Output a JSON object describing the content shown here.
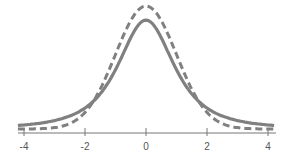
{
  "chart_data": {
    "type": "line",
    "title": "",
    "xlabel": "",
    "ylabel": "",
    "xlim": [
      -4.2,
      4.2
    ],
    "x_ticks": [
      -4,
      -2,
      0,
      2,
      4
    ],
    "x_tick_labels": [
      "-4",
      "-2",
      "0",
      "2",
      "4"
    ],
    "grid": false,
    "legend": null,
    "series": [
      {
        "name": "standard normal",
        "style": "dashed",
        "color": "#808080",
        "peak": 0.399
      },
      {
        "name": "t-distribution",
        "style": "solid",
        "color": "#808080",
        "peak": 0.354
      }
    ]
  },
  "colors": {
    "curve": "#808080",
    "axis": "#666666",
    "text": "#555555"
  }
}
